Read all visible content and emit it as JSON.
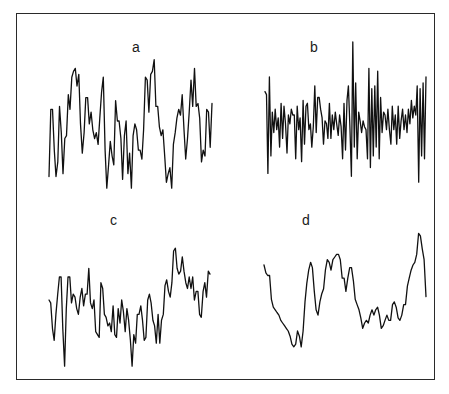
{
  "figure": {
    "border_color": "#2a2a2a",
    "line_color": "#111111"
  },
  "chart_data": [
    {
      "type": "line",
      "title": "a",
      "xlabel": "",
      "ylabel": "",
      "grid": false,
      "legend": null,
      "box": {
        "x0": 49,
        "x1": 212,
        "y_top": 48,
        "y_bottom": 194
      },
      "values": [
        12,
        58,
        58,
        30,
        12,
        22,
        60,
        42,
        14,
        38,
        40,
        68,
        58,
        80,
        84,
        86,
        74,
        82,
        48,
        28,
        42,
        66,
        66,
        48,
        56,
        44,
        38,
        42,
        34,
        52,
        70,
        80,
        30,
        4,
        20,
        36,
        26,
        20,
        64,
        50,
        50,
        38,
        10,
        40,
        50,
        14,
        28,
        4,
        40,
        48,
        44,
        30,
        30,
        24,
        44,
        80,
        78,
        56,
        82,
        84,
        92,
        60,
        60,
        46,
        40,
        44,
        26,
        8,
        14,
        18,
        4,
        34,
        42,
        52,
        58,
        54,
        68,
        44,
        24,
        38,
        56,
        78,
        60,
        86,
        60,
        62,
        52,
        22,
        30,
        26,
        58,
        56,
        32,
        62
      ]
    },
    {
      "type": "line",
      "title": "b",
      "xlabel": "",
      "ylabel": "",
      "grid": false,
      "legend": null,
      "box": {
        "x0": 265,
        "x1": 426,
        "y_top": 42,
        "y_bottom": 188
      },
      "values": [
        66,
        64,
        10,
        76,
        22,
        52,
        38,
        54,
        40,
        48,
        28,
        58,
        34,
        56,
        44,
        24,
        50,
        44,
        54,
        50,
        50,
        20,
        56,
        40,
        48,
        18,
        60,
        30,
        56,
        58,
        40,
        44,
        28,
        42,
        70,
        38,
        62,
        62,
        54,
        48,
        30,
        46,
        44,
        34,
        58,
        34,
        50,
        40,
        52,
        44,
        36,
        50,
        42,
        20,
        58,
        26,
        60,
        70,
        42,
        8,
        100,
        28,
        72,
        20,
        52,
        46,
        38,
        46,
        42,
        40,
        20,
        82,
        14,
        68,
        22,
        70,
        28,
        80,
        20,
        62,
        38,
        52,
        50,
        40,
        54,
        40,
        30,
        56,
        40,
        50,
        30,
        56,
        34,
        46,
        54,
        40,
        50,
        38,
        54,
        44,
        60,
        48,
        56,
        50,
        70,
        4,
        68,
        22,
        72,
        20,
        76
      ]
    },
    {
      "type": "line",
      "title": "c",
      "xlabel": "",
      "ylabel": "",
      "grid": false,
      "legend": null,
      "box": {
        "x0": 49,
        "x1": 210,
        "y_top": 228,
        "y_bottom": 372
      },
      "values": [
        50,
        48,
        30,
        22,
        40,
        54,
        66,
        66,
        30,
        4,
        44,
        66,
        66,
        48,
        54,
        52,
        44,
        40,
        52,
        58,
        46,
        54,
        54,
        72,
        48,
        44,
        50,
        28,
        26,
        24,
        62,
        58,
        40,
        38,
        32,
        34,
        28,
        46,
        26,
        24,
        44,
        34,
        50,
        42,
        28,
        44,
        36,
        22,
        4,
        26,
        20,
        40,
        40,
        46,
        36,
        22,
        24,
        50,
        54,
        48,
        36,
        32,
        20,
        40,
        20,
        36,
        40,
        60,
        64,
        56,
        52,
        62,
        84,
        86,
        72,
        68,
        70,
        80,
        70,
        62,
        58,
        66,
        58,
        66,
        50,
        56,
        56,
        40,
        38,
        56,
        62,
        52,
        70,
        68
      ]
    },
    {
      "type": "line",
      "title": "d",
      "xlabel": "",
      "ylabel": "",
      "grid": false,
      "legend": null,
      "box": {
        "x0": 264,
        "x1": 426,
        "y_top": 228,
        "y_bottom": 360
      },
      "values": [
        72,
        66,
        64,
        64,
        46,
        40,
        38,
        36,
        34,
        30,
        28,
        26,
        24,
        22,
        18,
        12,
        10,
        12,
        22,
        18,
        10,
        22,
        44,
        58,
        68,
        74,
        70,
        52,
        38,
        34,
        44,
        50,
        54,
        68,
        76,
        74,
        68,
        76,
        78,
        80,
        80,
        76,
        62,
        62,
        52,
        62,
        70,
        70,
        60,
        46,
        42,
        38,
        32,
        24,
        28,
        30,
        28,
        34,
        38,
        34,
        38,
        40,
        34,
        24,
        26,
        30,
        34,
        30,
        30,
        42,
        44,
        40,
        32,
        30,
        34,
        42,
        42,
        56,
        62,
        68,
        72,
        74,
        80,
        96,
        94,
        84,
        76,
        48
      ]
    }
  ]
}
